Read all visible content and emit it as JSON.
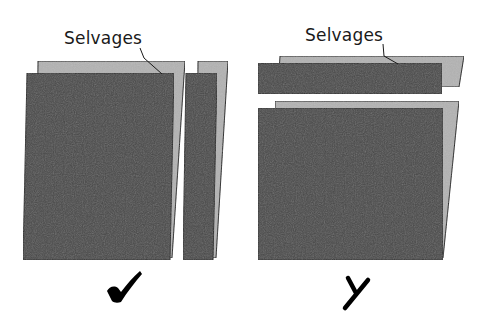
{
  "diagram": {
    "left_panel": {
      "label": "Selvages",
      "verdict": "correct",
      "verdict_icon": "checkmark-icon"
    },
    "right_panel": {
      "label": "Selvages",
      "verdict": "incorrect",
      "verdict_icon": "x-mark-icon"
    },
    "colors": {
      "fabric_front": "#4a4a4a",
      "fabric_back": "#b3b3b3",
      "outline": "#1a1a1a",
      "background": "#ffffff",
      "mark": "#000000"
    }
  }
}
